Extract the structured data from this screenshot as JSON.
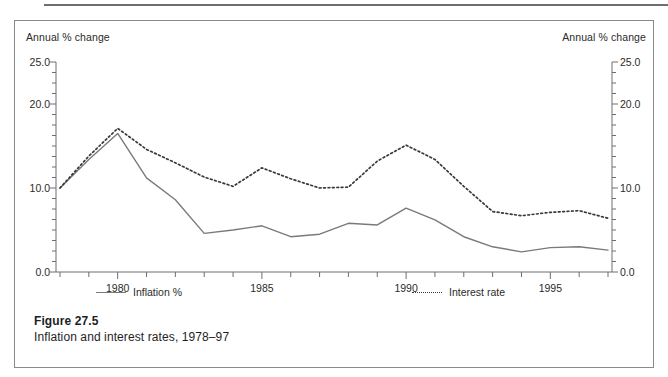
{
  "figure": {
    "caption_title": "Figure 27.5",
    "caption_subtitle": "Inflation and interest rates, 1978–97"
  },
  "axis_titles": {
    "left": "Annual % change",
    "right": "Annual % change"
  },
  "legend": {
    "inflation_label": "Inflation %",
    "interest_label": "Interest rate"
  },
  "colors": {
    "inflation_line": "#7a7a7a",
    "interest_line": "#3a3a3a",
    "axis": "#6e6e6e",
    "frame": "#8a8a8a",
    "text": "#2b2b2b",
    "background": "#ffffff"
  },
  "chart_data": {
    "type": "line",
    "title": "Inflation and interest rates, 1978–97",
    "xlabel": "",
    "ylabel": "Annual % change",
    "y2label": "Annual % change",
    "xlim": [
      1978,
      1997
    ],
    "ylim": [
      0.0,
      25.0
    ],
    "ytick_labels": [
      "0.0",
      "10.0",
      "20.0",
      "25.0"
    ],
    "ytick_values": [
      0.0,
      10.0,
      20.0,
      25.0
    ],
    "yminor_step": 1.25,
    "xtick_labels": [
      "1980",
      "1985",
      "1990",
      "1995"
    ],
    "xtick_values": [
      1980,
      1985,
      1990,
      1995
    ],
    "xminor_step": 1,
    "grid": false,
    "legend_position": "below-axis",
    "x": [
      1978,
      1979,
      1980,
      1981,
      1982,
      1983,
      1984,
      1985,
      1986,
      1987,
      1988,
      1989,
      1990,
      1991,
      1992,
      1993,
      1994,
      1995,
      1996,
      1997
    ],
    "series": [
      {
        "name": "Inflation %",
        "style": "solid",
        "color": "#7a7a7a",
        "values": [
          10.0,
          13.4,
          16.5,
          11.2,
          8.6,
          4.6,
          5.0,
          5.5,
          4.2,
          4.5,
          5.8,
          5.6,
          7.6,
          6.2,
          4.2,
          3.0,
          2.4,
          2.9,
          3.0,
          2.6
        ]
      },
      {
        "name": "Interest rate",
        "style": "dotted",
        "color": "#3a3a3a",
        "values": [
          10.0,
          13.8,
          17.1,
          14.6,
          13.0,
          11.3,
          10.2,
          12.4,
          11.1,
          10.0,
          10.1,
          13.2,
          15.1,
          13.4,
          10.2,
          7.2,
          6.7,
          7.1,
          7.3,
          6.4
        ]
      }
    ]
  }
}
